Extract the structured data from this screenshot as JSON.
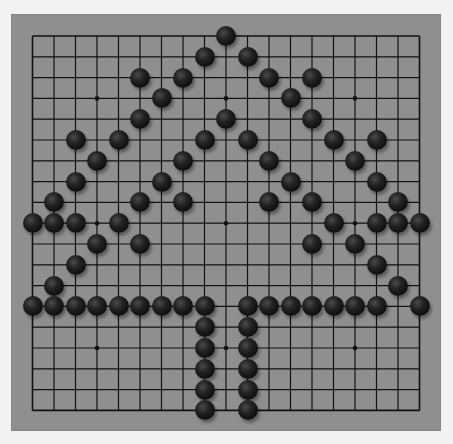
{
  "board": {
    "size": 19,
    "colors": {
      "board": "#8f8f8f",
      "line": "#111111",
      "stone_black": "#111111",
      "page_background": "#f3f3f3"
    },
    "star_points": [
      [
        3,
        3
      ],
      [
        3,
        9
      ],
      [
        3,
        15
      ],
      [
        9,
        3
      ],
      [
        9,
        9
      ],
      [
        9,
        15
      ],
      [
        15,
        3
      ],
      [
        15,
        9
      ],
      [
        15,
        15
      ]
    ],
    "stones": [
      {
        "row": 0,
        "col": 9,
        "color": "black"
      },
      {
        "row": 1,
        "col": 8,
        "color": "black"
      },
      {
        "row": 1,
        "col": 10,
        "color": "black"
      },
      {
        "row": 2,
        "col": 5,
        "color": "black"
      },
      {
        "row": 2,
        "col": 7,
        "color": "black"
      },
      {
        "row": 2,
        "col": 11,
        "color": "black"
      },
      {
        "row": 2,
        "col": 13,
        "color": "black"
      },
      {
        "row": 3,
        "col": 6,
        "color": "black"
      },
      {
        "row": 3,
        "col": 12,
        "color": "black"
      },
      {
        "row": 4,
        "col": 5,
        "color": "black"
      },
      {
        "row": 4,
        "col": 9,
        "color": "black"
      },
      {
        "row": 4,
        "col": 13,
        "color": "black"
      },
      {
        "row": 5,
        "col": 2,
        "color": "black"
      },
      {
        "row": 5,
        "col": 4,
        "color": "black"
      },
      {
        "row": 5,
        "col": 8,
        "color": "black"
      },
      {
        "row": 5,
        "col": 10,
        "color": "black"
      },
      {
        "row": 5,
        "col": 14,
        "color": "black"
      },
      {
        "row": 5,
        "col": 16,
        "color": "black"
      },
      {
        "row": 6,
        "col": 3,
        "color": "black"
      },
      {
        "row": 6,
        "col": 7,
        "color": "black"
      },
      {
        "row": 6,
        "col": 11,
        "color": "black"
      },
      {
        "row": 6,
        "col": 15,
        "color": "black"
      },
      {
        "row": 7,
        "col": 2,
        "color": "black"
      },
      {
        "row": 7,
        "col": 6,
        "color": "black"
      },
      {
        "row": 7,
        "col": 12,
        "color": "black"
      },
      {
        "row": 7,
        "col": 16,
        "color": "black"
      },
      {
        "row": 8,
        "col": 1,
        "color": "black"
      },
      {
        "row": 8,
        "col": 5,
        "color": "black"
      },
      {
        "row": 8,
        "col": 7,
        "color": "black"
      },
      {
        "row": 8,
        "col": 11,
        "color": "black"
      },
      {
        "row": 8,
        "col": 13,
        "color": "black"
      },
      {
        "row": 8,
        "col": 17,
        "color": "black"
      },
      {
        "row": 9,
        "col": 0,
        "color": "black"
      },
      {
        "row": 9,
        "col": 1,
        "color": "black"
      },
      {
        "row": 9,
        "col": 2,
        "color": "black"
      },
      {
        "row": 9,
        "col": 4,
        "color": "black"
      },
      {
        "row": 9,
        "col": 14,
        "color": "black"
      },
      {
        "row": 9,
        "col": 16,
        "color": "black"
      },
      {
        "row": 9,
        "col": 17,
        "color": "black"
      },
      {
        "row": 9,
        "col": 18,
        "color": "black"
      },
      {
        "row": 10,
        "col": 3,
        "color": "black"
      },
      {
        "row": 10,
        "col": 5,
        "color": "black"
      },
      {
        "row": 10,
        "col": 13,
        "color": "black"
      },
      {
        "row": 10,
        "col": 15,
        "color": "black"
      },
      {
        "row": 11,
        "col": 2,
        "color": "black"
      },
      {
        "row": 11,
        "col": 16,
        "color": "black"
      },
      {
        "row": 12,
        "col": 1,
        "color": "black"
      },
      {
        "row": 12,
        "col": 17,
        "color": "black"
      },
      {
        "row": 13,
        "col": 0,
        "color": "black"
      },
      {
        "row": 13,
        "col": 1,
        "color": "black"
      },
      {
        "row": 13,
        "col": 2,
        "color": "black"
      },
      {
        "row": 13,
        "col": 3,
        "color": "black"
      },
      {
        "row": 13,
        "col": 4,
        "color": "black"
      },
      {
        "row": 13,
        "col": 5,
        "color": "black"
      },
      {
        "row": 13,
        "col": 6,
        "color": "black"
      },
      {
        "row": 13,
        "col": 7,
        "color": "black"
      },
      {
        "row": 13,
        "col": 8,
        "color": "black"
      },
      {
        "row": 13,
        "col": 10,
        "color": "black"
      },
      {
        "row": 13,
        "col": 11,
        "color": "black"
      },
      {
        "row": 13,
        "col": 12,
        "color": "black"
      },
      {
        "row": 13,
        "col": 13,
        "color": "black"
      },
      {
        "row": 13,
        "col": 14,
        "color": "black"
      },
      {
        "row": 13,
        "col": 15,
        "color": "black"
      },
      {
        "row": 13,
        "col": 16,
        "color": "black"
      },
      {
        "row": 13,
        "col": 18,
        "color": "black"
      },
      {
        "row": 14,
        "col": 8,
        "color": "black"
      },
      {
        "row": 14,
        "col": 10,
        "color": "black"
      },
      {
        "row": 15,
        "col": 8,
        "color": "black"
      },
      {
        "row": 15,
        "col": 10,
        "color": "black"
      },
      {
        "row": 16,
        "col": 8,
        "color": "black"
      },
      {
        "row": 16,
        "col": 10,
        "color": "black"
      },
      {
        "row": 17,
        "col": 8,
        "color": "black"
      },
      {
        "row": 17,
        "col": 10,
        "color": "black"
      },
      {
        "row": 18,
        "col": 8,
        "color": "black"
      },
      {
        "row": 18,
        "col": 10,
        "color": "black"
      }
    ]
  }
}
